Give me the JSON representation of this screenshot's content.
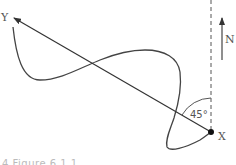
{
  "diagram": {
    "labels": {
      "start_point": "Y",
      "end_point": "X",
      "north": "N",
      "angle": "45°"
    },
    "caption": "4 Figure 6.1.1"
  }
}
